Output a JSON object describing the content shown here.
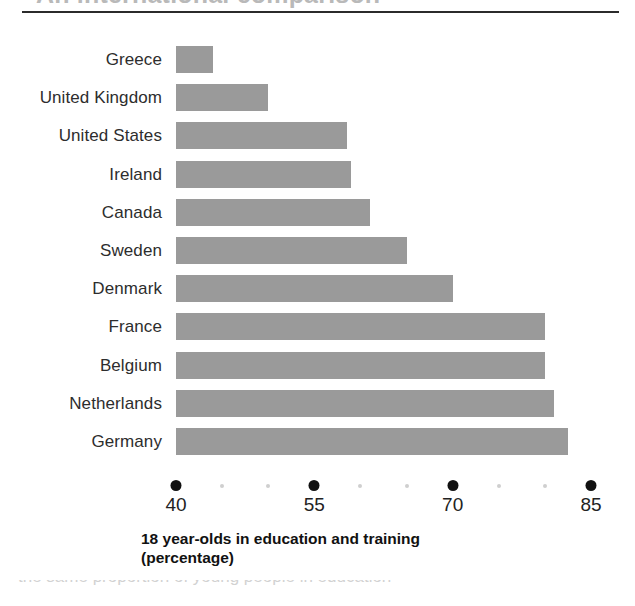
{
  "page": {
    "clipped_title_fragment": "An international comparison",
    "bottom_artifact_fragment": "the same proportion of young people in education"
  },
  "chart_data": {
    "type": "bar",
    "orientation": "horizontal",
    "title": "",
    "xlabel_line1": "18 year-olds in education and training",
    "xlabel_line2": "(percentage)",
    "ylabel": "",
    "categories": [
      "Greece",
      "United Kingdom",
      "United States",
      "Ireland",
      "Canada",
      "Sweden",
      "Denmark",
      "France",
      "Belgium",
      "Netherlands",
      "Germany"
    ],
    "values": [
      44,
      50,
      58.5,
      59,
      61,
      65,
      70,
      80,
      80,
      81,
      82.5
    ],
    "xlim": [
      40,
      85
    ],
    "xticks": [
      40,
      55,
      70,
      85
    ],
    "xtick_labels": [
      "40",
      "55",
      "70",
      "85"
    ],
    "minor_tick_step": 5,
    "grid": false,
    "legend": false,
    "bar_color": "#9a9a9a",
    "axis_tick_color": "#111111",
    "minor_tick_color": "#cfcfcf",
    "rule_color": "#2b2b2b"
  }
}
